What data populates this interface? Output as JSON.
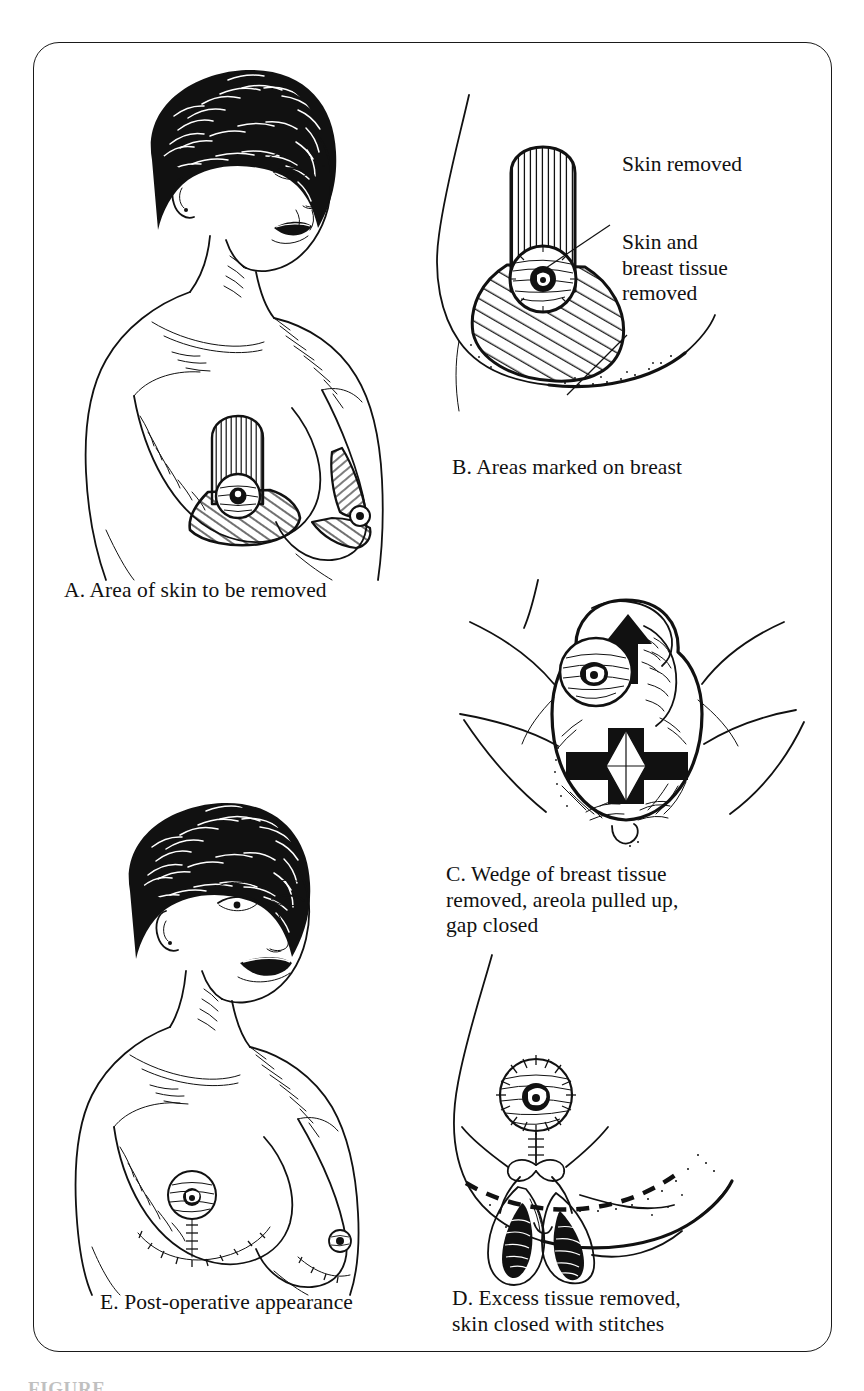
{
  "figure": {
    "frame_border_color": "#1a1a1a",
    "background_color": "#ffffff",
    "ink_color": "#111111",
    "bottom_label": "FIGURE"
  },
  "panels": [
    {
      "id": "A",
      "letter": "A.",
      "caption": "A. Area of skin to be removed",
      "subject": "front view of woman, torso and head, markings drawn on right breast",
      "markings": [
        "vertical-hatched keyhole above areola",
        "diagonal-hatched lower breast wedge"
      ]
    },
    {
      "id": "B",
      "letter": "B.",
      "caption": "B. Areas marked on breast",
      "subject": "close-up of breast profile with marked keyhole pattern",
      "callouts": [
        {
          "name": "skin-removed",
          "text": "Skin removed",
          "points_to": "vertical-hatched region above areola"
        },
        {
          "name": "skin-and-breast-tissue-removed",
          "text": "Skin and\nbreast tissue\nremoved",
          "points_to": "diagonal-hatched region below areola"
        }
      ]
    },
    {
      "id": "C",
      "letter": "C.",
      "caption": "C. Wedge of breast tissue\nremoved, areola pulled up,\ngap closed",
      "subject": "operative view, wedge excision with arrow showing areola moved upward"
    },
    {
      "id": "D",
      "letter": "D.",
      "caption": "D. Excess tissue removed,\nskin closed with stitches",
      "subject": "breast profile with dashed line, stitched vertical closure and retracted flaps"
    },
    {
      "id": "E",
      "letter": "E.",
      "caption": "E. Post-operative appearance",
      "subject": "front view of woman after surgery with stitched inverted-T scar"
    }
  ],
  "callout_labels": {
    "skin_removed": "Skin removed",
    "skin_and_breast_tissue_removed": "Skin and\nbreast tissue\nremoved"
  },
  "captions": {
    "a": "A. Area of skin to be removed",
    "b": "B. Areas marked on breast",
    "c": "C. Wedge of breast tissue\nremoved, areola pulled up,\ngap closed",
    "d": "D. Excess tissue removed,\nskin closed with stitches",
    "e": "E. Post-operative appearance"
  }
}
